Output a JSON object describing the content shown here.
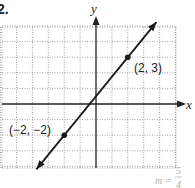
{
  "problem_number": "2.",
  "chart_data": {
    "type": "line",
    "title": "",
    "xlabel": "x",
    "ylabel": "y",
    "xlim": [
      -6,
      5
    ],
    "ylim": [
      -4,
      5
    ],
    "grid": true,
    "series": [
      {
        "name": "line",
        "points": [
          [
            -2,
            -2
          ],
          [
            2,
            3
          ]
        ],
        "slope": 1.25,
        "arrows": "both"
      }
    ],
    "annotations": [
      {
        "text": "(2, 3)",
        "x": 2,
        "y": 3
      },
      {
        "text": "(−2, −2)",
        "x": -2,
        "y": -2
      },
      {
        "text": "m = 5/4",
        "position": "bottom-right"
      }
    ]
  },
  "labels": {
    "x_axis": "x",
    "y_axis": "y",
    "point_a": "(2, 3)",
    "point_b": "(−2, −2)",
    "slope_m": "m =",
    "slope_num": "5",
    "slope_den": "4"
  },
  "colors": {
    "grid": "#8a8a8a",
    "axis": "#222222",
    "line": "#1a1a1a",
    "slope_text": "#b0b0b0"
  }
}
